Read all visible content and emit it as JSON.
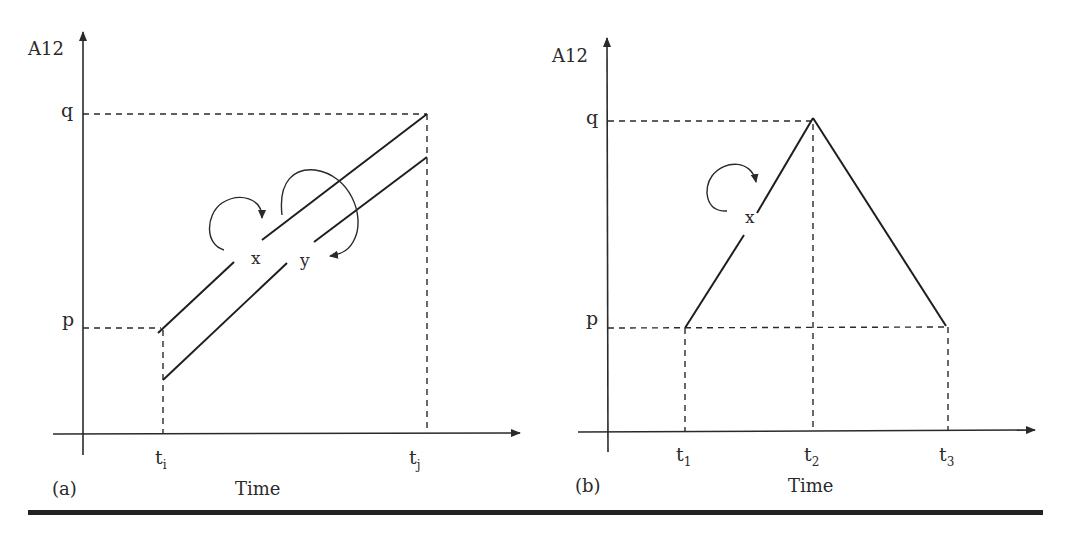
{
  "panels": [
    {
      "id": "a",
      "caption": "(a)",
      "y_axis_label": "A12",
      "x_axis_label": "Time",
      "y_ticks": [
        "q",
        "p"
      ],
      "x_ticks": {
        "t_i": "t",
        "t_i_sub": "i",
        "t_j": "t",
        "t_j_sub": "j"
      },
      "series_labels": {
        "x": "x",
        "y": "y"
      }
    },
    {
      "id": "b",
      "caption": "(b)",
      "y_axis_label": "A12",
      "x_axis_label": "Time",
      "y_ticks": [
        "q",
        "p"
      ],
      "x_ticks": {
        "t1": "t",
        "t1_sub": "1",
        "t2": "t",
        "t2_sub": "2",
        "t3": "t",
        "t3_sub": "3"
      },
      "series_labels": {
        "x": "x"
      }
    }
  ],
  "colors": {
    "ink": "#2a2a2a",
    "background": "#ffffff"
  }
}
